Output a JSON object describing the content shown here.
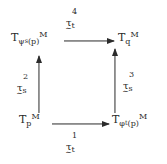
{
  "figure": {
    "kind": "commutative-diagram",
    "background_color": "#ffffff",
    "ink_color": "#2b2b2b"
  },
  "nodes": {
    "top_left": {
      "name": "tangent-space-psi-s-p",
      "full_text": "T_{ψ_s(p)} M",
      "base": "T",
      "subscript_main": "ψ",
      "subscript_inner": "s",
      "subscript_arg": "(p)",
      "manifold": "M"
    },
    "top_right": {
      "name": "tangent-space-q",
      "full_text": "T_q M",
      "base": "T",
      "subscript_main": "q",
      "manifold": "M"
    },
    "bottom_left": {
      "name": "tangent-space-p",
      "full_text": "T_p M",
      "base": "T",
      "subscript_main": "p",
      "manifold": "M"
    },
    "bottom_right": {
      "name": "tangent-space-phi-t-p",
      "full_text": "T_{φ_t(p)} M",
      "base": "T",
      "subscript_main": "φ",
      "subscript_inner": "t",
      "subscript_arg": "(p)",
      "manifold": "M"
    }
  },
  "arrows": {
    "top": {
      "name": "arrow-top",
      "direction": "left-to-right",
      "from": "top_left",
      "to": "top_right",
      "label": {
        "full_text": "τ̃_t^4",
        "glyph": "τ",
        "tilde": "∼",
        "subscript": "t",
        "superscript": "4"
      }
    },
    "bottom": {
      "name": "arrow-bottom",
      "direction": "left-to-right",
      "from": "bottom_left",
      "to": "bottom_right",
      "label": {
        "full_text": "τ̃_t^1",
        "glyph": "τ",
        "tilde": "∼",
        "subscript": "t",
        "superscript": "1"
      }
    },
    "left": {
      "name": "arrow-left",
      "direction": "bottom-to-top",
      "from": "bottom_left",
      "to": "top_left",
      "label": {
        "full_text": "τ̃_s^2",
        "glyph": "τ",
        "tilde": "∼",
        "subscript": "s",
        "superscript": "2"
      }
    },
    "right": {
      "name": "arrow-right",
      "direction": "bottom-to-top",
      "from": "bottom_right",
      "to": "top_right",
      "label": {
        "full_text": "τ̃_s^3",
        "glyph": "τ",
        "tilde": "∼",
        "subscript": "s",
        "superscript": "3"
      }
    }
  }
}
